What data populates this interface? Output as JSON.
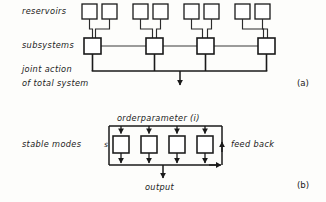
{
  "figure": {
    "width": 326,
    "height": 202,
    "background": "#fdfdfb",
    "stroke_color": "#1a1a1a",
    "thin_stroke_color": "#3a3a3a"
  },
  "panel_a": {
    "tag": "(a)",
    "labels": {
      "reservoirs": "reservoirs",
      "subsystems": "subsystems",
      "joint_action_line1": "joint action",
      "joint_action_line2": "of total system"
    },
    "reservoir_boxes": [
      {
        "x": 82,
        "y": 4,
        "w": 15,
        "h": 15
      },
      {
        "x": 102,
        "y": 4,
        "w": 15,
        "h": 15
      },
      {
        "x": 133,
        "y": 4,
        "w": 15,
        "h": 15
      },
      {
        "x": 153,
        "y": 4,
        "w": 15,
        "h": 15
      },
      {
        "x": 184,
        "y": 4,
        "w": 15,
        "h": 15
      },
      {
        "x": 204,
        "y": 4,
        "w": 15,
        "h": 15
      },
      {
        "x": 235,
        "y": 4,
        "w": 15,
        "h": 15
      },
      {
        "x": 255,
        "y": 4,
        "w": 15,
        "h": 15
      }
    ],
    "subsystem_boxes": [
      {
        "x": 84,
        "y": 38,
        "w": 17,
        "h": 16
      },
      {
        "x": 146,
        "y": 38,
        "w": 17,
        "h": 16
      },
      {
        "x": 197,
        "y": 38,
        "w": 17,
        "h": 16
      },
      {
        "x": 258,
        "y": 38,
        "w": 17,
        "h": 16
      }
    ],
    "bus_y": 71,
    "arrow_x": 180,
    "arrow_tip_y": 88,
    "subsystem_count": 4,
    "reservoir_count": 8
  },
  "panel_b": {
    "tag": "(b)",
    "labels": {
      "orderparameter": "orderparameter (i)",
      "stable_modes": "stable modes",
      "s": "s",
      "feed_back": "feed back",
      "output": "output"
    },
    "mode_boxes": [
      {
        "x": 113,
        "y": 136,
        "w": 16,
        "h": 17
      },
      {
        "x": 141,
        "y": 136,
        "w": 16,
        "h": 17
      },
      {
        "x": 169,
        "y": 136,
        "w": 16,
        "h": 17
      },
      {
        "x": 197,
        "y": 136,
        "w": 16,
        "h": 17
      }
    ],
    "top_bus_y": 126,
    "bottom_bus_y": 165,
    "left_rail_x": 109,
    "right_rail_x": 222,
    "output_arrow_x": 163,
    "output_arrow_tip_y": 181,
    "feedback_arrow_up_y": 144,
    "mode_count": 4
  }
}
